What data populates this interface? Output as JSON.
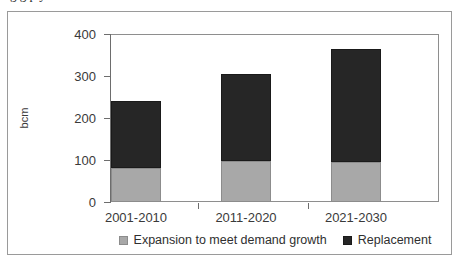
{
  "figure": {
    "clipped_title_fragment": "g   g                                     p   y"
  },
  "chart_data": {
    "type": "bar",
    "stacked": true,
    "title": "",
    "xlabel": "",
    "ylabel": "bcm",
    "categories": [
      "2001-2010",
      "2011-2020",
      "2021-2030"
    ],
    "ylim": [
      0,
      400
    ],
    "ytick_labels": [
      "0",
      "100",
      "200",
      "300",
      "400"
    ],
    "ytick_values": [
      0,
      100,
      200,
      300,
      400
    ],
    "grid": false,
    "legend_position": "bottom",
    "series": [
      {
        "name": "Expansion to meet demand growth",
        "color": "#a8a8a8",
        "values": [
          81,
          98,
          95
        ]
      },
      {
        "name": "Replacement",
        "color": "#262626",
        "values": [
          159,
          207,
          269
        ]
      }
    ],
    "totals": [
      240,
      305,
      364
    ]
  },
  "legend": {
    "items": [
      {
        "label": "Expansion to meet demand growth",
        "swatch": "gray-swatch-icon"
      },
      {
        "label": "Replacement",
        "swatch": "black-swatch-icon"
      }
    ]
  }
}
